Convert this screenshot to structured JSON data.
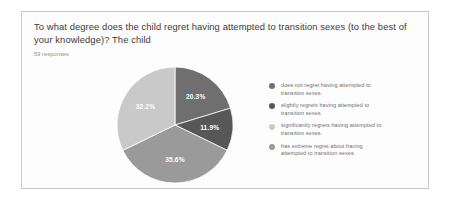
{
  "card": {
    "question": "To what degree does the child regret having attempted to transition sexes (to the best of your knowledge)? The child",
    "response_count": "59 responses"
  },
  "chart_data": {
    "type": "pie",
    "title": "To what degree does the child regret having attempted to transition sexes (to the best of your knowledge)? The child",
    "subtitle": "59 responses",
    "categories": [
      "does not regret having attempted to transition sexes.",
      "slightly regrets having attempted to transition sexes.",
      "significantly regrets having attempted to transition sexes.",
      "has extreme regret about having attempted to transition sexes."
    ],
    "values": [
      20.3,
      11.9,
      35.6,
      32.2
    ],
    "value_labels": [
      "20.3%",
      "11.9%",
      "35.6%",
      "32.2%"
    ],
    "colors": [
      "#6f6f6f",
      "#575757",
      "#9a9a9a",
      "#c9c9c9"
    ],
    "total_responses": 59,
    "legend_position": "right",
    "grid": false
  },
  "legend": {
    "items": [
      {
        "line1": "does not regret having attempted to",
        "line2": "transition sexes.",
        "color": "#6f6f6f"
      },
      {
        "line1": "slightly regrets having attempted to",
        "line2": "transition sexes.",
        "color": "#575757"
      },
      {
        "line1": "significantly regrets having attempted to",
        "line2": "transition sexes.",
        "color": "#c9c9c9"
      },
      {
        "line1": "has extreme regret about having",
        "line2": "attempted to transition sexes.",
        "color": "#9a9a9a"
      }
    ]
  }
}
